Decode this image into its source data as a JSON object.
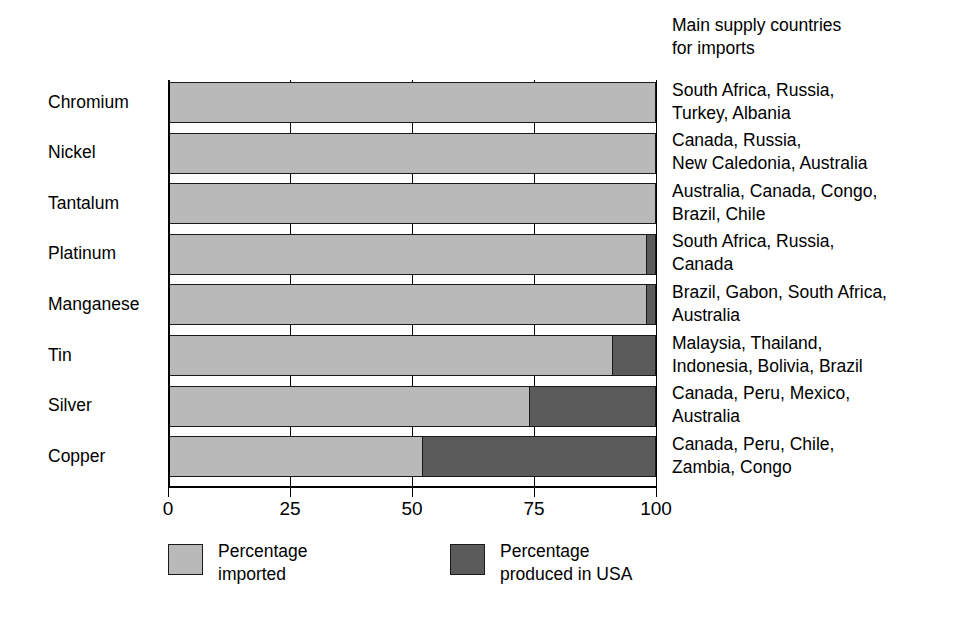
{
  "chart_data": {
    "type": "bar",
    "orientation": "horizontal",
    "stacked": true,
    "title": "",
    "subtitle": "",
    "xlabel": "",
    "ylabel": "",
    "xlim": [
      0,
      100
    ],
    "xticks": [
      0,
      25,
      50,
      75,
      100
    ],
    "xtick_labels": [
      "0",
      "25",
      "50",
      "75",
      "100"
    ],
    "grid": true,
    "grid_axis": "x",
    "legend_position": "bottom",
    "categories": [
      "Chromium",
      "Nickel",
      "Tantalum",
      "Platinum",
      "Manganese",
      "Tin",
      "Silver",
      "Copper"
    ],
    "series": [
      {
        "name": "Percentage imported",
        "color": "#b9b9b9",
        "values": [
          100,
          100,
          100,
          98,
          98,
          91,
          74,
          52
        ]
      },
      {
        "name": "Percentage produced in USA",
        "color": "#5b5b5b",
        "values": [
          0,
          0,
          0,
          2,
          2,
          9,
          26,
          48
        ]
      }
    ],
    "annotation_column_header": "Main supply countries\nfor imports",
    "annotations": [
      "South Africa, Russia,\nTurkey, Albania",
      "Canada, Russia,\nNew Caledonia, Australia",
      "Australia, Canada, Congo,\nBrazil, Chile",
      "South Africa, Russia,\nCanada",
      "Brazil, Gabon, South Africa,\nAustralia",
      "Malaysia, Thailand,\nIndonesia, Bolivia, Brazil",
      "Canada, Peru, Mexico,\nAustralia",
      "Canada, Peru, Chile,\nZambia, Congo"
    ]
  },
  "legend": {
    "entries": [
      {
        "label": "Percentage\nimported",
        "color": "#b9b9b9"
      },
      {
        "label": "Percentage\nproduced in USA",
        "color": "#5b5b5b"
      }
    ]
  },
  "axis": {
    "tick_labels": [
      "0",
      "25",
      "50",
      "75",
      "100"
    ]
  },
  "annotation_header": "Main supply countries\nfor imports"
}
